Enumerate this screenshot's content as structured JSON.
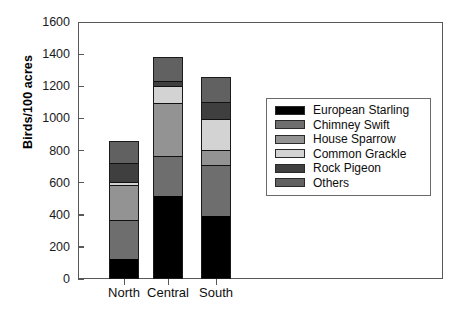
{
  "chart_data": {
    "type": "bar",
    "subtype": "stacked-bar",
    "title": "",
    "xlabel": "",
    "ylabel": "Birds/100 acres",
    "categories": [
      "North",
      "Central",
      "South"
    ],
    "ylim": [
      0,
      1600
    ],
    "yticks": [
      0,
      200,
      400,
      600,
      800,
      1000,
      1200,
      1400,
      1600
    ],
    "ytick_labels": [
      "0",
      "200",
      "400",
      "600",
      "800",
      "1000",
      "1200",
      "1400",
      "1600"
    ],
    "grid": false,
    "legend_position": "center-right",
    "series": [
      {
        "name": "European Starling",
        "color": "#000000",
        "values": [
          125,
          515,
          390
        ]
      },
      {
        "name": "Chimney Swift",
        "color": "#6e6e6e",
        "values": [
          245,
          250,
          320
        ]
      },
      {
        "name": "House Sparrow",
        "color": "#939393",
        "values": [
          215,
          330,
          95
        ]
      },
      {
        "name": "Common Grackle",
        "color": "#d3d3d3",
        "values": [
          20,
          105,
          190
        ]
      },
      {
        "name": "Rock Pigeon",
        "color": "#3f3f3f",
        "values": [
          115,
          35,
          110
        ]
      },
      {
        "name": "Others",
        "color": "#616161",
        "values": [
          140,
          150,
          150
        ]
      }
    ],
    "totals": [
      860,
      1385,
      1255
    ]
  },
  "legend": {
    "items": [
      {
        "label": "European Starling",
        "color": "#000000"
      },
      {
        "label": "Chimney Swift",
        "color": "#6e6e6e"
      },
      {
        "label": "House Sparrow",
        "color": "#939393"
      },
      {
        "label": "Common Grackle",
        "color": "#d3d3d3"
      },
      {
        "label": "Rock Pigeon",
        "color": "#3f3f3f"
      },
      {
        "label": "Others",
        "color": "#616161"
      }
    ]
  },
  "axes": {
    "y_title": "Birds/100 acres",
    "y_max": 1600,
    "y_min": 0
  }
}
